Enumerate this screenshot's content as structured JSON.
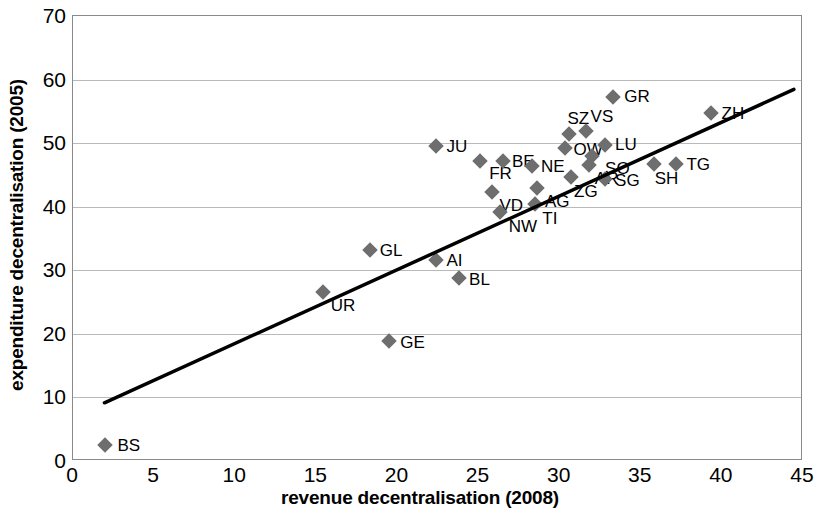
{
  "chart_data": {
    "type": "scatter",
    "title": "",
    "xlabel": "revenue decentralisation (2008)",
    "ylabel": "expenditure decentralisation (2005)",
    "xlim": [
      0,
      45
    ],
    "ylim": [
      0,
      70
    ],
    "xticks": [
      0,
      5,
      10,
      15,
      20,
      25,
      30,
      35,
      40,
      45
    ],
    "yticks": [
      0,
      10,
      20,
      30,
      40,
      50,
      60,
      70
    ],
    "grid": "horizontal",
    "legend": "none",
    "marker_color": "#6e6e6e",
    "marker_shape": "diamond",
    "trendline": {
      "color": "#000000",
      "x0": 2.0,
      "y0": 9.0,
      "x1": 44.5,
      "y1": 58.3
    },
    "points": [
      {
        "label": "BS",
        "x": 2.0,
        "y": 2.5,
        "lx": 12,
        "ly": 0
      },
      {
        "label": "UR",
        "x": 15.4,
        "y": 26.6,
        "lx": 8,
        "ly": 13
      },
      {
        "label": "GL",
        "x": 18.3,
        "y": 33.2,
        "lx": 10,
        "ly": 0
      },
      {
        "label": "GE",
        "x": 19.5,
        "y": 18.9,
        "lx": 11,
        "ly": 1
      },
      {
        "label": "AI",
        "x": 22.4,
        "y": 31.6,
        "lx": 10,
        "ly": 0
      },
      {
        "label": "JU",
        "x": 22.4,
        "y": 49.6,
        "lx": 10,
        "ly": 0
      },
      {
        "label": "BL",
        "x": 23.8,
        "y": 28.8,
        "lx": 10,
        "ly": 1
      },
      {
        "label": "FR",
        "x": 25.1,
        "y": 47.2,
        "lx": 9,
        "ly": 12
      },
      {
        "label": "BE",
        "x": 26.5,
        "y": 47.2,
        "lx": 9,
        "ly": 0
      },
      {
        "label": "VD",
        "x": 25.8,
        "y": 42.3,
        "lx": 8,
        "ly": 13
      },
      {
        "label": "NW",
        "x": 26.3,
        "y": 39.1,
        "lx": 9,
        "ly": 14
      },
      {
        "label": "NE",
        "x": 28.3,
        "y": 46.4,
        "lx": 9,
        "ly": 0
      },
      {
        "label": "AG",
        "x": 28.6,
        "y": 43.0,
        "lx": 8,
        "ly": 13
      },
      {
        "label": "TI",
        "x": 28.5,
        "y": 40.5,
        "lx": 7,
        "ly": 14
      },
      {
        "label": "OW",
        "x": 30.3,
        "y": 49.2,
        "lx": 9,
        "ly": 1
      },
      {
        "label": "SZ",
        "x": 30.6,
        "y": 51.5,
        "lx": -2,
        "ly": -16
      },
      {
        "label": "ZG",
        "x": 30.7,
        "y": 44.7,
        "lx": 3,
        "ly": 14
      },
      {
        "label": "VS",
        "x": 31.6,
        "y": 51.9,
        "lx": 5,
        "ly": -15
      },
      {
        "label": "AR",
        "x": 31.8,
        "y": 46.5,
        "lx": 6,
        "ly": 13
      },
      {
        "label": "SG",
        "x": 32.8,
        "y": 44.3,
        "lx": 10,
        "ly": 1
      },
      {
        "label": "LU",
        "x": 32.8,
        "y": 49.7,
        "lx": 10,
        "ly": -1
      },
      {
        "label": "SO",
        "x": 32.0,
        "y": 48.0,
        "lx": 13,
        "ly": 12
      },
      {
        "label": "GR",
        "x": 33.3,
        "y": 57.3,
        "lx": 11,
        "ly": -1
      },
      {
        "label": "SH",
        "x": 35.8,
        "y": 46.7,
        "lx": 1,
        "ly": 14
      },
      {
        "label": "TG",
        "x": 37.2,
        "y": 46.7,
        "lx": 10,
        "ly": 0
      },
      {
        "label": "ZH",
        "x": 39.3,
        "y": 54.8,
        "lx": 11,
        "ly": 0
      }
    ]
  }
}
